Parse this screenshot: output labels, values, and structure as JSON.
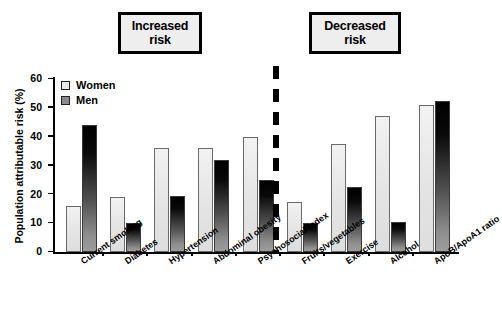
{
  "annotations": {
    "increased": {
      "line1": "Increased",
      "line2": "risk"
    },
    "decreased": {
      "line1": "Decreased",
      "line2": "risk"
    }
  },
  "chart_data": {
    "type": "bar",
    "title": "",
    "xlabel": "",
    "ylabel": "Population attributable risk (%)",
    "ylim": [
      0,
      60
    ],
    "yticks": [
      0,
      10,
      20,
      30,
      40,
      50,
      60
    ],
    "ytick_labels": [
      "0",
      "10",
      "20",
      "30",
      "40",
      "50",
      "60"
    ],
    "grid": false,
    "legend_position": "top-left",
    "categories": [
      "Current smoking",
      "Diabetes",
      "Hypertension",
      "Abdominal obesity",
      "Psychosocial index",
      "Fruits/vegetables",
      "Exercise",
      "Alcohol",
      "ApoB/ApoA1 ratio"
    ],
    "series": [
      {
        "name": "Women",
        "color": "#e9e9e9",
        "values": [
          16,
          19,
          36,
          36,
          40,
          17.5,
          37.5,
          47,
          51
        ]
      },
      {
        "name": "Men",
        "color": "#555555",
        "values": [
          44,
          10,
          19.5,
          32,
          25,
          10,
          22.5,
          10.5,
          52.5
        ]
      }
    ],
    "annotations_groups": [
      {
        "label": "Increased risk",
        "categories": [
          "Current smoking",
          "Diabetes",
          "Hypertension",
          "Abdominal obesity",
          "Psychosocial index"
        ]
      },
      {
        "label": "Decreased risk",
        "categories": [
          "Fruits/vegetables",
          "Exercise",
          "Alcohol",
          "ApoB/ApoA1 ratio"
        ]
      }
    ],
    "divider": {
      "style": "dashed",
      "after_category": "Psychosocial index"
    }
  }
}
